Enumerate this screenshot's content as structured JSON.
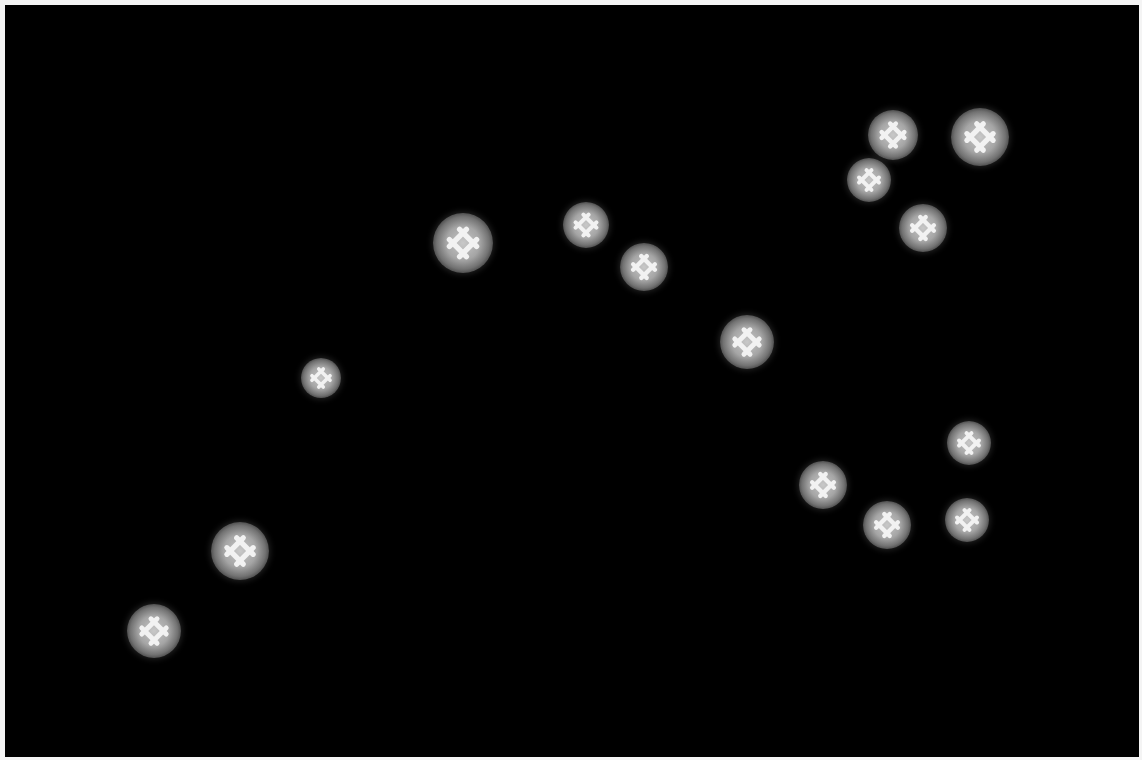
{
  "scene": {
    "description": "Star-like glowing lattice symbols scattered on black background",
    "background_color": "#000000",
    "border_color": "#f4f4f4",
    "glow_color": "#a5a5a5",
    "glyph_color": "#f2f2f2"
  },
  "stars": [
    {
      "x": 893,
      "y": 135,
      "r": 25
    },
    {
      "x": 980,
      "y": 137,
      "r": 29
    },
    {
      "x": 869,
      "y": 180,
      "r": 22
    },
    {
      "x": 923,
      "y": 228,
      "r": 24
    },
    {
      "x": 463,
      "y": 243,
      "r": 30
    },
    {
      "x": 586,
      "y": 225,
      "r": 23
    },
    {
      "x": 644,
      "y": 267,
      "r": 24
    },
    {
      "x": 747,
      "y": 342,
      "r": 27
    },
    {
      "x": 321,
      "y": 378,
      "r": 20
    },
    {
      "x": 969,
      "y": 443,
      "r": 22
    },
    {
      "x": 823,
      "y": 485,
      "r": 24
    },
    {
      "x": 887,
      "y": 525,
      "r": 24
    },
    {
      "x": 967,
      "y": 520,
      "r": 22
    },
    {
      "x": 240,
      "y": 551,
      "r": 29
    },
    {
      "x": 154,
      "y": 631,
      "r": 27
    }
  ]
}
